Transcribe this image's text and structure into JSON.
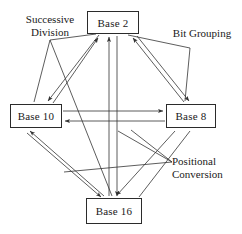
{
  "diagram": {
    "stroke_color": "#333333",
    "box_border_color": "#2b2b2b",
    "background": "#ffffff",
    "nodes": [
      {
        "id": "base2",
        "label": "Base 2",
        "x": 87,
        "y": 11,
        "w": 52,
        "h": 23
      },
      {
        "id": "base10",
        "label": "Base 10",
        "x": 10,
        "y": 104,
        "w": 52,
        "h": 24
      },
      {
        "id": "base8",
        "label": "Base 8",
        "x": 166,
        "y": 104,
        "w": 50,
        "h": 24
      },
      {
        "id": "base16",
        "label": "Base 16",
        "x": 86,
        "y": 198,
        "w": 56,
        "h": 26
      }
    ],
    "annotations": [
      {
        "id": "successive",
        "label": "Successive\nDivision",
        "x": 8,
        "y": 13
      },
      {
        "id": "bit_grouping",
        "label": "Bit Grouping",
        "x": 166,
        "y": 27
      },
      {
        "id": "positional",
        "label": "Positional\nConversion",
        "x": 172,
        "y": 155
      }
    ],
    "edges": [
      {
        "from": "base10",
        "to": "base2",
        "method": "successive"
      },
      {
        "from": "base2",
        "to": "base10",
        "method": "positional"
      },
      {
        "from": "base16",
        "to": "base2",
        "method": "bit_grouping"
      },
      {
        "from": "base2",
        "to": "base16",
        "method": "bit_grouping"
      },
      {
        "from": "base8",
        "to": "base2",
        "method": "bit_grouping"
      },
      {
        "from": "base2",
        "to": "base8",
        "method": "bit_grouping"
      },
      {
        "from": "base10",
        "to": "base8",
        "method": "successive"
      },
      {
        "from": "base8",
        "to": "base10",
        "method": "positional"
      },
      {
        "from": "base10",
        "to": "base16",
        "method": "successive"
      },
      {
        "from": "base16",
        "to": "base10",
        "method": "positional"
      }
    ]
  }
}
